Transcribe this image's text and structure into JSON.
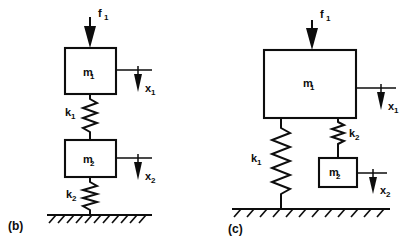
{
  "figure": {
    "background_color": "#ffffff",
    "line_color": "#0d0d0d",
    "width": 411,
    "height": 242
  },
  "panels": [
    {
      "tag": "(b)",
      "description": "Series chain: force f1 on mass m1, spring k1 to mass m2, spring k2 to ground",
      "force": {
        "symbol": "f",
        "subscript": "1",
        "direction": "down"
      },
      "masses": [
        {
          "symbol": "m",
          "subscript": "1"
        },
        {
          "symbol": "m",
          "subscript": "2"
        }
      ],
      "springs": [
        {
          "symbol": "k",
          "subscript": "1"
        },
        {
          "symbol": "k",
          "subscript": "2"
        }
      ],
      "displacements": [
        {
          "symbol": "x",
          "subscript": "1",
          "direction": "down"
        },
        {
          "symbol": "x",
          "subscript": "2",
          "direction": "down"
        }
      ],
      "ground": {
        "hatch_count": 11,
        "hatch_direction": "right-leaning"
      }
    },
    {
      "tag": "(c)",
      "description": "Parallel branch: force f1 on large mass m1, spring k1 to ground, spring k2 to mass m2",
      "force": {
        "symbol": "f",
        "subscript": "1",
        "direction": "down"
      },
      "masses": [
        {
          "symbol": "m",
          "subscript": "1"
        },
        {
          "symbol": "m",
          "subscript": "2"
        }
      ],
      "springs": [
        {
          "symbol": "k",
          "subscript": "1"
        },
        {
          "symbol": "k",
          "subscript": "2"
        }
      ],
      "displacements": [
        {
          "symbol": "x",
          "subscript": "1",
          "direction": "down"
        },
        {
          "symbol": "x",
          "subscript": "2",
          "direction": "down"
        }
      ],
      "ground": {
        "hatch_count": 12,
        "hatch_direction": "left-leaning"
      }
    }
  ]
}
